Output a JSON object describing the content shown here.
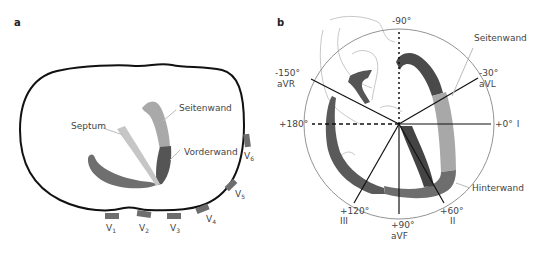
{
  "panel_a": {
    "label": "a",
    "wall_labels": {
      "septum": "Septum",
      "lateral": "Seitenwand",
      "anterior": "Vorderwand"
    },
    "electrodes": [
      {
        "lead": "V",
        "sub": "1"
      },
      {
        "lead": "V",
        "sub": "2"
      },
      {
        "lead": "V",
        "sub": "3"
      },
      {
        "lead": "V",
        "sub": "4"
      },
      {
        "lead": "V",
        "sub": "5"
      },
      {
        "lead": "V",
        "sub": "6"
      }
    ]
  },
  "panel_b": {
    "label": "b",
    "wall_labels": {
      "lateral": "Seitenwand",
      "inferior": "Hinterwand"
    },
    "axes": [
      {
        "angle": "-90°",
        "lead": ""
      },
      {
        "angle": "-30°",
        "lead": "aVL"
      },
      {
        "angle": "+0°",
        "lead": "I"
      },
      {
        "angle": "+60°",
        "lead": "II"
      },
      {
        "angle": "+90°",
        "lead": "aVF"
      },
      {
        "angle": "+120°",
        "lead": "III"
      },
      {
        "angle": "+180°",
        "lead": ""
      },
      {
        "angle": "-150°",
        "lead": "aVR"
      }
    ]
  },
  "colors": {
    "outline": "#111111",
    "wall_dark": "#555555",
    "wall_mid": "#777777",
    "wall_light": "#aaaaaa",
    "wall_lighter": "#c4c4c4",
    "electrode": "#6e6e6e",
    "leader": "#bbbbbb"
  }
}
